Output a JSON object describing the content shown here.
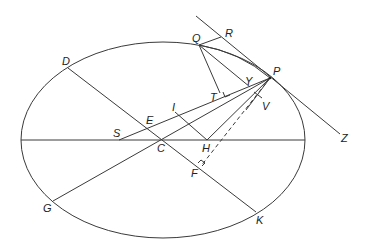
{
  "diagram": {
    "title": "",
    "ellipse": {
      "cx": 163,
      "cy": 140,
      "rx": 142,
      "ry": 98
    },
    "points": {
      "Q": {
        "x": 199,
        "y": 45,
        "label": "Q"
      },
      "R": {
        "x": 221,
        "y": 34,
        "label": "R"
      },
      "D": {
        "x": 68,
        "y": 68,
        "label": "D"
      },
      "P": {
        "x": 270,
        "y": 78,
        "label": "P"
      },
      "Y": {
        "x": 250,
        "y": 86,
        "label": "Y"
      },
      "T": {
        "x": 220,
        "y": 93,
        "label": "T"
      },
      "V": {
        "x": 257,
        "y": 100,
        "label": "V"
      },
      "I": {
        "x": 175,
        "y": 111,
        "label": "I"
      },
      "E": {
        "x": 152,
        "y": 118,
        "label": "E"
      },
      "S": {
        "x": 119,
        "y": 140,
        "label": "S"
      },
      "C": {
        "x": 163,
        "y": 140,
        "label": "C"
      },
      "H": {
        "x": 207,
        "y": 140,
        "label": "H"
      },
      "Z": {
        "x": 345,
        "y": 137,
        "label": "Z"
      },
      "F": {
        "x": 201,
        "y": 166,
        "label": "F"
      },
      "G": {
        "x": 53,
        "y": 201,
        "label": "G"
      },
      "K": {
        "x": 256,
        "y": 212,
        "label": "K"
      }
    },
    "labels": [
      "Q",
      "R",
      "D",
      "P",
      "Y",
      "T",
      "V",
      "I",
      "E",
      "S",
      "C",
      "H",
      "Z",
      "F",
      "G",
      "K"
    ]
  }
}
